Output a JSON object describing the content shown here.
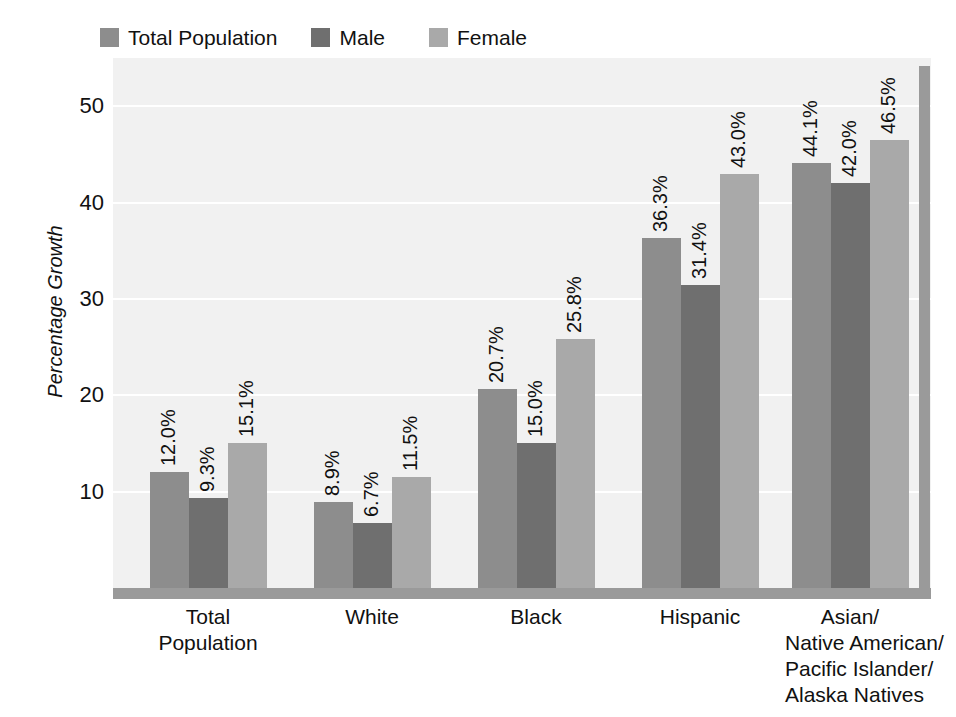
{
  "chart_data": {
    "type": "bar",
    "title": "",
    "subtitle": "",
    "xlabel": "",
    "ylabel": "Percentage Growth",
    "ylim": [
      0,
      55
    ],
    "yticks": [
      10,
      20,
      30,
      40,
      50
    ],
    "ytick_labels": [
      "10",
      "20",
      "30",
      "40",
      "50"
    ],
    "grid": true,
    "legend_position": "top-left",
    "categories": [
      "Total Population",
      "White",
      "Black",
      "Hispanic",
      "Asian/ Native American/ Pacific Islander/ Alaska Natives"
    ],
    "category_lines": [
      [
        "Total",
        "Population"
      ],
      [
        "White"
      ],
      [
        "Black"
      ],
      [
        "Hispanic"
      ],
      [
        "Asian/",
        "Native American/",
        "Pacific Islander/",
        "Alaska Natives"
      ]
    ],
    "series": [
      {
        "name": "Total Population",
        "color": "#8d8d8d",
        "values": [
          12.0,
          8.9,
          20.7,
          36.3,
          44.1
        ],
        "labels": [
          "12.0%",
          "8.9%",
          "20.7%",
          "36.3%",
          "44.1%"
        ]
      },
      {
        "name": "Male",
        "color": "#6f6f6f",
        "values": [
          9.3,
          6.7,
          15.0,
          31.4,
          42.0
        ],
        "labels": [
          "9.3%",
          "6.7%",
          "15.0%",
          "31.4%",
          "42.0%"
        ]
      },
      {
        "name": "Female",
        "color": "#a9a9a9",
        "values": [
          15.1,
          11.5,
          25.8,
          43.0,
          46.5
        ],
        "labels": [
          "15.1%",
          "11.5%",
          "25.8%",
          "43.0%",
          "46.5%"
        ]
      }
    ],
    "colors": {
      "plot_background": "#f1f1f1",
      "gridline": "#ffffff",
      "axis_bar": "#9a9a9a",
      "text": "#111111"
    }
  },
  "legend": {
    "items": [
      {
        "label": "Total Population",
        "color": "#8d8d8d"
      },
      {
        "label": "Male",
        "color": "#6f6f6f"
      },
      {
        "label": "Female",
        "color": "#a9a9a9"
      }
    ]
  },
  "axis": {
    "y_title": "Percentage Growth"
  }
}
